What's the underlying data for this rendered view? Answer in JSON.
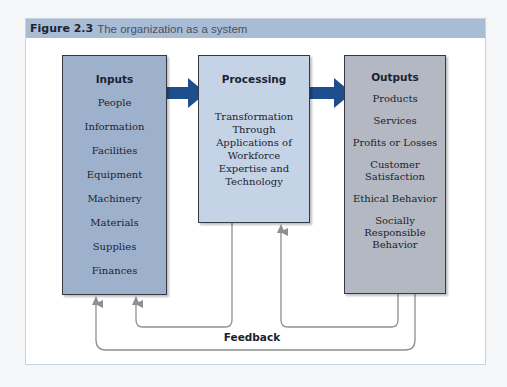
{
  "figure": {
    "number": "Figure 2.3",
    "caption": "The organization as a system",
    "colors": {
      "header_band": "#a9bcd6",
      "inputs_fill": "#9eb1cc",
      "processing_fill": "#c4d3e6",
      "outputs_fill": "#b3b8c2",
      "flow_arrow": "#1f4e8c",
      "feedback_line": "#8c8f94"
    }
  },
  "inputs": {
    "title": "Inputs",
    "items": [
      "People",
      "Information",
      "Facilities",
      "Equipment",
      "Machinery",
      "Materials",
      "Supplies",
      "Finances"
    ]
  },
  "processing": {
    "title": "Processing",
    "description": "Transformation Through Applications of Workforce Expertise and Technology"
  },
  "outputs": {
    "title": "Outputs",
    "items": [
      "Products",
      "Services",
      "Profits or Losses",
      "Customer Satisfaction",
      "Ethical Behavior",
      "Socially Responsible Behavior"
    ]
  },
  "feedback": {
    "label": "Feedback"
  }
}
